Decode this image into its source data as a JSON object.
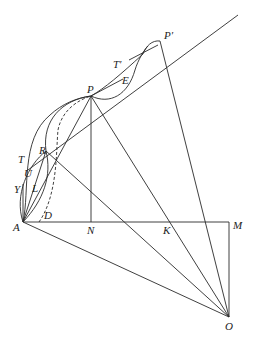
{
  "figure": {
    "type": "geometric-construction",
    "points": {
      "A": {
        "label": "A",
        "x": 23,
        "y": 222
      },
      "N": {
        "label": "N",
        "x": 91,
        "y": 222
      },
      "K": {
        "label": "K",
        "x": 168,
        "y": 222
      },
      "M": {
        "label": "M",
        "x": 229,
        "y": 222
      },
      "O": {
        "label": "O",
        "x": 229,
        "y": 317
      },
      "P": {
        "label": "P",
        "x": 91,
        "y": 96
      },
      "P_prime": {
        "label": "P′",
        "x": 160,
        "y": 41
      },
      "R": {
        "label": "R",
        "x": 46,
        "y": 151
      },
      "D": {
        "label": "D",
        "x": 39,
        "y": 222
      }
    },
    "labels": {
      "T": "T",
      "T_prime": "T′",
      "E": "E",
      "U": "U",
      "Y": "Y",
      "L": "L",
      "P": "P",
      "P_prime": "P′",
      "R": "R",
      "D": "D",
      "A": "A",
      "N": "N",
      "K": "K",
      "M": "M",
      "O": "O"
    }
  }
}
